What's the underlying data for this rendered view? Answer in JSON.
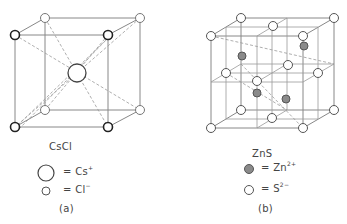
{
  "panels": [
    {
      "id": "a",
      "compound": "CsCl",
      "caption": "(a)",
      "legend": [
        {
          "symbol": "large-open-circle",
          "text": "= Cs",
          "superscript": "+"
        },
        {
          "symbol": "small-open-circle",
          "text": "= Cl",
          "superscript": "−"
        }
      ]
    },
    {
      "id": "b",
      "compound": "ZnS",
      "caption": "(b)",
      "legend": [
        {
          "symbol": "filled-gray-circle",
          "text": "= Zn",
          "superscript": "2+"
        },
        {
          "symbol": "small-open-circle",
          "text": "= S",
          "superscript": "2−"
        }
      ]
    }
  ],
  "colors": {
    "line": "#777777",
    "dashed": "#999999",
    "atom_stroke": "#555555",
    "atom_bold_stroke": "#222222",
    "zn_fill": "#8a8a8a"
  }
}
